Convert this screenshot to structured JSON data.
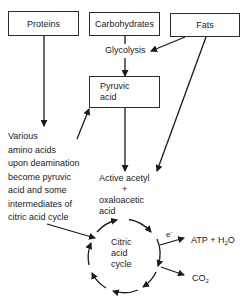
{
  "nodes": {
    "proteins": "Proteins",
    "carbohydrates": "Carbohydrates",
    "fats": "Fats",
    "glycolysis": "Glycolysis",
    "pyruvic_acid": [
      "Pyruvic",
      "acid"
    ],
    "amino_acids_note": [
      "Various",
      "amino acids",
      "upon deamination",
      "become pyruvic",
      "acid and some",
      "intermediates of",
      "citric acid cycle"
    ],
    "acetyl": [
      "Active acetyl",
      "+",
      "oxaloacetic",
      "acid"
    ],
    "cycle": [
      "Citric",
      "acid",
      "cycle"
    ],
    "electron": "e",
    "electron_sup": "-",
    "atp_prefix": "ATP + H",
    "atp_sub": "2",
    "atp_suffix": "O",
    "co2_prefix": "CO",
    "co2_sub": "2"
  },
  "colors": {
    "line": "#1a1a1a",
    "box_border": "#2a2a2a",
    "background": "#ffffff"
  }
}
